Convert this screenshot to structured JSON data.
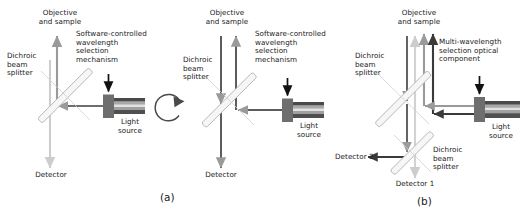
{
  "figure": {
    "background": "#ffffff",
    "width": 529,
    "height": 221
  },
  "colors": {
    "text": "#1a1a1a",
    "arrow_dark": "#3a3a3a",
    "arrow_mid": "#9a9a9a",
    "arrow_light": "#cdcdcd",
    "splitter_fill": "#f2f2f2",
    "splitter_stroke": "#b5b5b5",
    "source_body_dark": "#6e6e6e",
    "source_band_dark": "#4a4a4a",
    "source_band_mid": "#8c8c8c",
    "source_band_light": "#d8d8d8",
    "rotation_arrow": "#4a4a4a"
  },
  "panels": [
    {
      "id": "a",
      "caption": "(a)",
      "labels": {
        "objective": "Objective\nand sample",
        "dichroic": "Dichroic\nbeam\nsplitter",
        "mechanism": "Software-controlled\nwavelength\nselection\nmechanism",
        "light_source": "Light\nsource",
        "detector": "Detector"
      },
      "components": [
        {
          "name": "dichroic-beam-splitter",
          "type": "45deg-mirror"
        },
        {
          "name": "light-source",
          "type": "lamp-with-bands"
        },
        {
          "name": "wavelength-selection-mechanism",
          "type": "filter-block"
        }
      ],
      "beams": [
        {
          "name": "excitation-beam",
          "direction": "left",
          "shade": "dark"
        },
        {
          "name": "excitation-to-objective",
          "direction": "up",
          "shade": "mid"
        },
        {
          "name": "emission-to-detector",
          "direction": "down",
          "shade": "light"
        }
      ]
    },
    {
      "id": "rotation",
      "caption": "",
      "labels": {},
      "components": [
        {
          "name": "rotation-arrow",
          "type": "circular-arrow-clockwise"
        }
      ],
      "beams": []
    },
    {
      "id": "a2",
      "caption": "",
      "labels": {
        "objective": "Objective\nand sample",
        "dichroic": "Dichroic\nbeam\nsplitter",
        "mechanism": "Software-controlled\nwavelength\nselection\nmechanism",
        "light_source": "Light\nsource",
        "detector": "Detector"
      },
      "components": [
        {
          "name": "dichroic-beam-splitter",
          "type": "45deg-mirror"
        },
        {
          "name": "light-source",
          "type": "lamp-with-bands"
        },
        {
          "name": "wavelength-selection-mechanism",
          "type": "filter-block"
        }
      ],
      "beams": [
        {
          "name": "excitation-beam",
          "direction": "left",
          "shade": "dark"
        },
        {
          "name": "excitation-to-objective",
          "direction": "up",
          "shade": "dark"
        },
        {
          "name": "emission-to-detector",
          "direction": "down",
          "shade": "dark"
        }
      ]
    },
    {
      "id": "b",
      "caption": "(b)",
      "labels": {
        "objective": "Objective\nand sample",
        "dichroic1": "Dichroic\nbeam\nsplitter",
        "dichroic2": "Dichroic\nbeam\nsplitter",
        "mechanism": "Multi-wavelength\nselection optical\ncomponent",
        "light_source": "Light\nsource",
        "detector1": "Detector 1",
        "detector2": "Detector 2"
      },
      "components": [
        {
          "name": "dichroic-beam-splitter-1",
          "type": "45deg-mirror"
        },
        {
          "name": "dichroic-beam-splitter-2",
          "type": "45deg-mirror"
        },
        {
          "name": "light-source",
          "type": "lamp-with-bands"
        },
        {
          "name": "multi-wavelength-component",
          "type": "filter-block"
        }
      ],
      "beams": [
        {
          "name": "excitation-beam-upper",
          "direction": "left",
          "shade": "mid"
        },
        {
          "name": "excitation-beam-lower",
          "direction": "left",
          "shade": "dark"
        },
        {
          "name": "excitation-to-objective-dark",
          "direction": "up",
          "shade": "dark"
        },
        {
          "name": "excitation-to-objective-mid",
          "direction": "up",
          "shade": "mid"
        },
        {
          "name": "emission-light",
          "direction": "up",
          "shade": "light"
        },
        {
          "name": "emission-down-to-splitter",
          "direction": "down",
          "shade": "dark"
        },
        {
          "name": "emission-to-detector-1",
          "direction": "down",
          "shade": "light"
        },
        {
          "name": "emission-to-detector-2",
          "direction": "left",
          "shade": "dark"
        }
      ]
    }
  ]
}
